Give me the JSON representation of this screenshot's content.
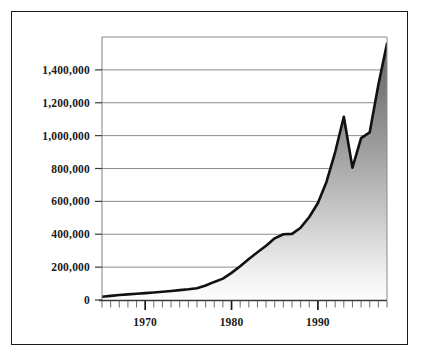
{
  "figure": {
    "background_color": "#ffffff",
    "frame_color": "#1a1a1a",
    "plot_area": {
      "left": 102,
      "top": 37,
      "right": 387,
      "bottom": 300
    }
  },
  "chart_data": {
    "type": "area",
    "title": "",
    "subtitle": "",
    "xlabel": "",
    "ylabel": "",
    "xlim": [
      1965,
      1998
    ],
    "ylim": [
      0,
      1600000
    ],
    "grid": true,
    "grid_axis": "y",
    "legend": false,
    "legend_position": "none",
    "line_color": "#111111",
    "line_width": 2.6,
    "fill_gradient": {
      "top": "#6e6e6e",
      "bottom": "#fbfbfb"
    },
    "xlabel_ticks": [
      "1970",
      "1980",
      "1990"
    ],
    "xlabel_tick_values": [
      1970,
      1980,
      1990
    ],
    "xtick_interval_years": 1,
    "ytick_labels": [
      "0",
      "200,000",
      "400,000",
      "600,000",
      "800,000",
      "1,000,000",
      "1,200,000",
      "1,400,000"
    ],
    "ytick_values": [
      0,
      200000,
      400000,
      600000,
      800000,
      1000000,
      1200000,
      1400000
    ],
    "x": [
      1965,
      1966,
      1967,
      1968,
      1969,
      1970,
      1971,
      1972,
      1973,
      1974,
      1975,
      1976,
      1977,
      1978,
      1979,
      1980,
      1981,
      1982,
      1983,
      1984,
      1985,
      1986,
      1987,
      1988,
      1989,
      1990,
      1991,
      1992,
      1993,
      1994,
      1995,
      1996,
      1997,
      1998
    ],
    "values": [
      20000,
      25000,
      30000,
      34000,
      38000,
      42000,
      46000,
      50000,
      55000,
      60000,
      65000,
      72000,
      88000,
      110000,
      130000,
      165000,
      205000,
      250000,
      290000,
      330000,
      375000,
      400000,
      402000,
      440000,
      505000,
      590000,
      720000,
      900000,
      1115000,
      805000,
      985000,
      1020000,
      1310000,
      1560000
    ],
    "series": [
      {
        "name": "Total",
        "values": [
          20000,
          25000,
          30000,
          34000,
          38000,
          42000,
          46000,
          50000,
          55000,
          60000,
          65000,
          72000,
          88000,
          110000,
          130000,
          165000,
          205000,
          250000,
          290000,
          330000,
          375000,
          400000,
          402000,
          440000,
          505000,
          590000,
          720000,
          900000,
          1115000,
          805000,
          985000,
          1020000,
          1310000,
          1560000
        ]
      }
    ],
    "annotations": []
  }
}
